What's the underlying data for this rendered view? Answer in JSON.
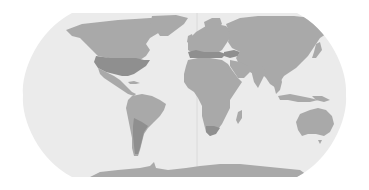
{
  "map": {
    "projection": "robinson",
    "width": 369,
    "height": 190,
    "colors": {
      "background": "#ffffff",
      "ocean": "#ebebeb",
      "land": "#a9a9a9",
      "land_highlight": "#8f8f8f",
      "meridian": "#d6d6d6"
    },
    "highlighted_regions": [
      "united-states",
      "argentina",
      "south-africa",
      "mediterranean-europe",
      "turkey"
    ]
  }
}
